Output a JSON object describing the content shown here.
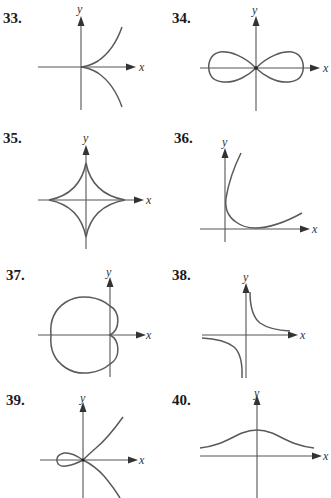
{
  "exercises": [
    {
      "number": "33.",
      "x_label": "x",
      "y_label": "y",
      "description": "semicubical parabola with cusp at origin, opening right"
    },
    {
      "number": "34.",
      "x_label": "x",
      "y_label": "y",
      "description": "lemniscate (figure-eight) centered at origin"
    },
    {
      "number": "35.",
      "x_label": "x",
      "y_label": "y",
      "description": "astroid with four cusps on the axes"
    },
    {
      "number": "36.",
      "x_label": "x",
      "y_label": "y",
      "description": "curve in first quadrant approaching y-axis and rising to the right"
    },
    {
      "number": "37.",
      "x_label": "x",
      "y_label": "y",
      "description": "cardioid with cusp at origin, extending to the left"
    },
    {
      "number": "38.",
      "x_label": "x",
      "y_label": "y",
      "description": "hyperbola-like curve with branches in quadrants I and III"
    },
    {
      "number": "39.",
      "x_label": "x",
      "y_label": "y",
      "description": "nodal cubic with loop to the left of origin"
    },
    {
      "number": "40.",
      "x_label": "x",
      "y_label": "y",
      "description": "bell-shaped curve above the x-axis, peak on y-axis"
    }
  ]
}
